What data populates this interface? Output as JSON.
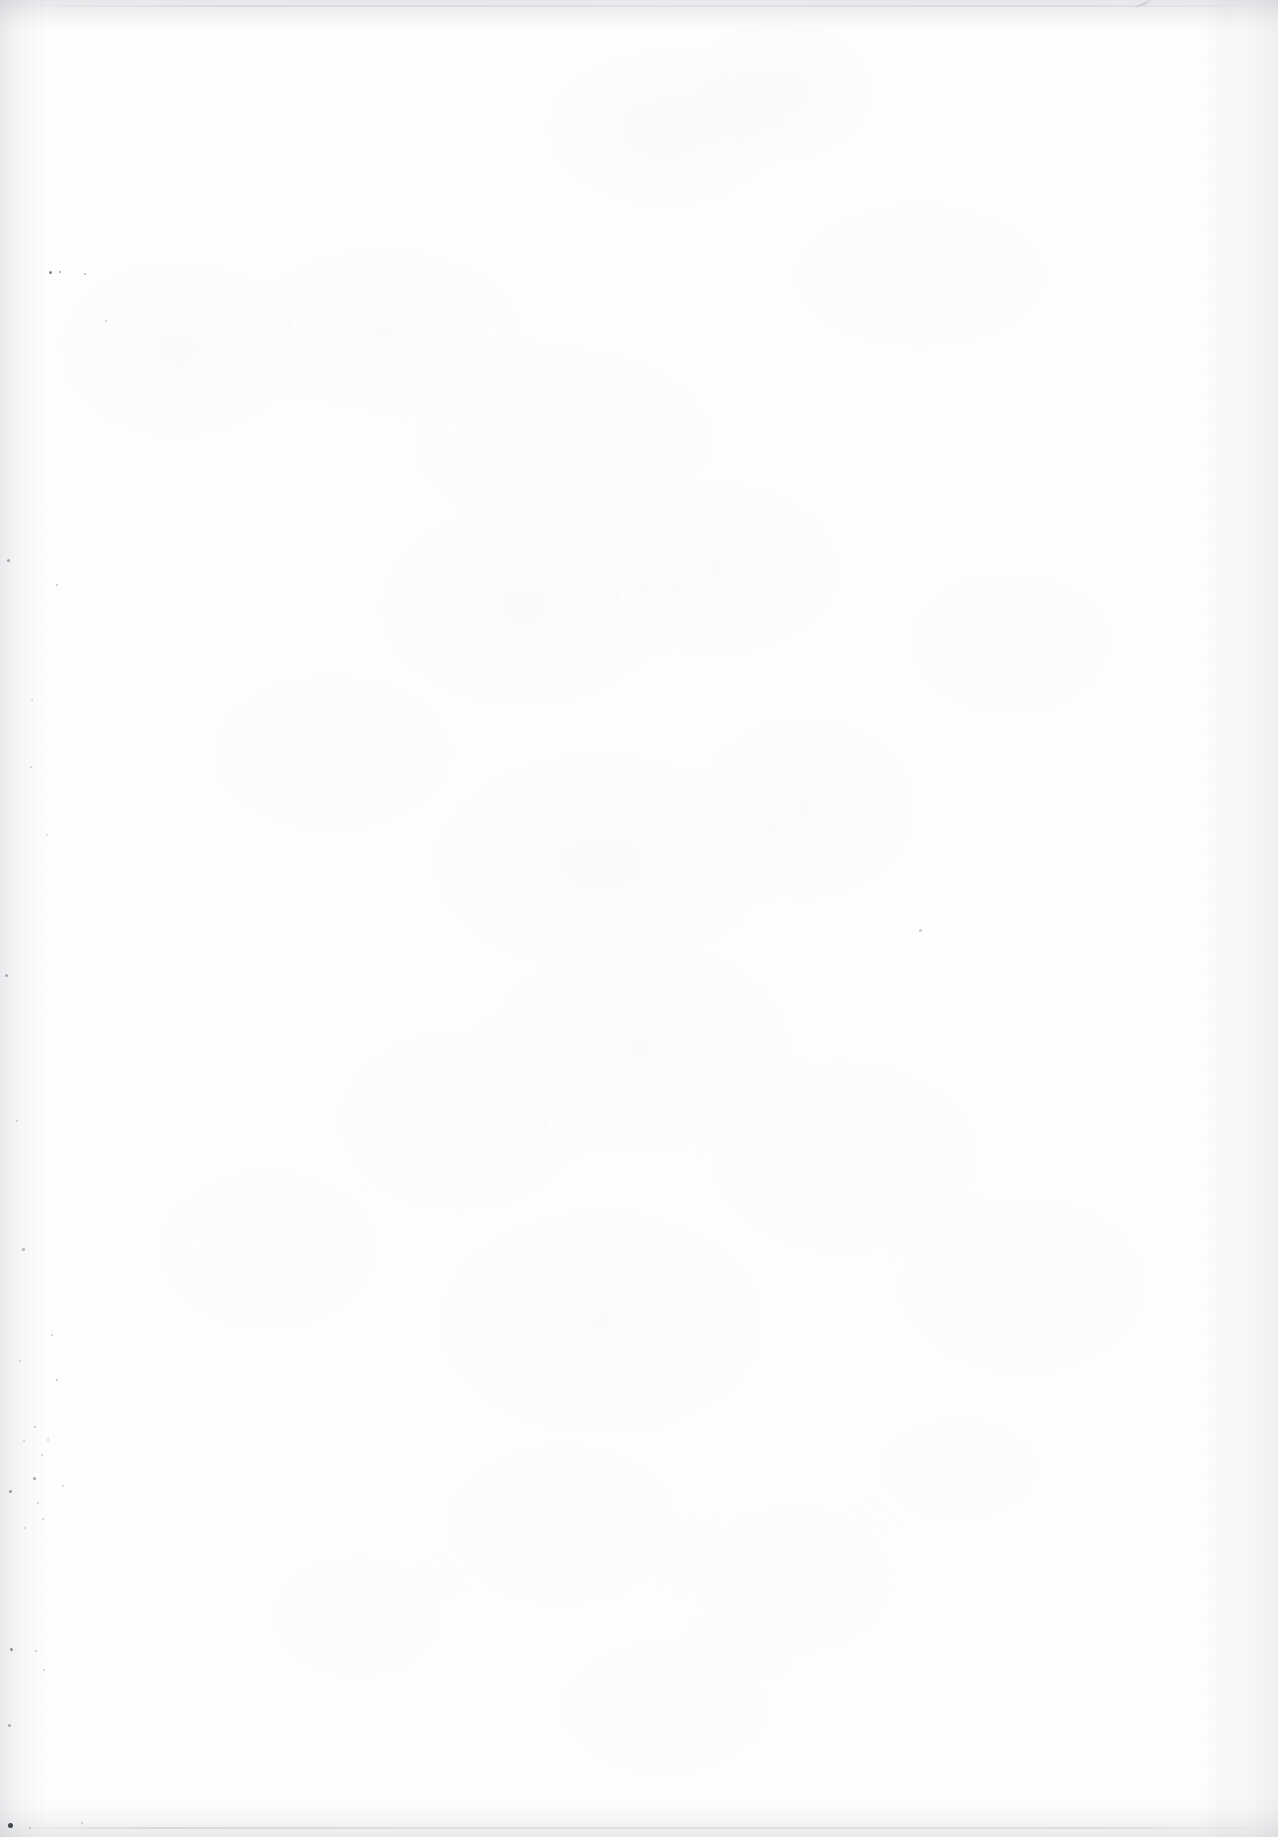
{
  "page": {
    "kind": "scanned-page",
    "content_state": "blank",
    "width_px": 1278,
    "height_px": 1837,
    "accessible_description": "Blank scanned page",
    "visible_text": "",
    "paper_color": "#fefefe",
    "grain_color": "#787d87",
    "edge_shadow_color": "#6c727e"
  },
  "artifacts": {
    "pen_stroke": {
      "name": "pen-stroke-mark",
      "x": 1132,
      "y": 8,
      "length": 26,
      "angle_deg": 24,
      "color": "#b9bcc2"
    },
    "specks": [
      {
        "x": 50,
        "y": 272,
        "size": 3,
        "color": "#4b4f57"
      },
      {
        "x": 60,
        "y": 272,
        "size": 2,
        "color": "#6a6e77"
      },
      {
        "x": 85,
        "y": 274,
        "size": 2,
        "color": "#8d9199"
      },
      {
        "x": 106,
        "y": 321,
        "size": 2,
        "color": "#b0b4ba"
      },
      {
        "x": 8,
        "y": 560,
        "size": 3,
        "color": "#7e828a"
      },
      {
        "x": 57,
        "y": 585,
        "size": 2,
        "color": "#a3a7ad"
      },
      {
        "x": 32,
        "y": 700,
        "size": 2,
        "color": "#b4b8be"
      },
      {
        "x": 31,
        "y": 767,
        "size": 2,
        "color": "#aeb2b8"
      },
      {
        "x": 47,
        "y": 835,
        "size": 2,
        "color": "#bbbfc4"
      },
      {
        "x": 920,
        "y": 930,
        "size": 3,
        "color": "#b6bac0"
      },
      {
        "x": 6,
        "y": 975,
        "size": 3,
        "color": "#8a8e96"
      },
      {
        "x": 17,
        "y": 1121,
        "size": 2,
        "color": "#a8acb2"
      },
      {
        "x": 23,
        "y": 1249,
        "size": 3,
        "color": "#8f939b"
      },
      {
        "x": 52,
        "y": 1335,
        "size": 2,
        "color": "#a6aab0"
      },
      {
        "x": 20,
        "y": 1361,
        "size": 2,
        "color": "#b2b6bc"
      },
      {
        "x": 57,
        "y": 1380,
        "size": 2,
        "color": "#a0a4ab"
      },
      {
        "x": 35,
        "y": 1427,
        "size": 2,
        "color": "#9ea2a9"
      },
      {
        "x": 48,
        "y": 1440,
        "size": 2,
        "color": "#aeb2b8"
      },
      {
        "x": 24,
        "y": 1441,
        "size": 2,
        "color": "#b4b8be"
      },
      {
        "x": 42,
        "y": 1455,
        "size": 2,
        "color": "#a9adb3"
      },
      {
        "x": 34,
        "y": 1478,
        "size": 3,
        "color": "#7d818a"
      },
      {
        "x": 63,
        "y": 1486,
        "size": 2,
        "color": "#b0b4ba"
      },
      {
        "x": 10,
        "y": 1491,
        "size": 3,
        "color": "#6f737c"
      },
      {
        "x": 38,
        "y": 1503,
        "size": 2,
        "color": "#b6bac0"
      },
      {
        "x": 43,
        "y": 1519,
        "size": 2,
        "color": "#a4a8ae"
      },
      {
        "x": 25,
        "y": 1528,
        "size": 2,
        "color": "#b0b4ba"
      },
      {
        "x": 11,
        "y": 1649,
        "size": 3,
        "color": "#5f636c"
      },
      {
        "x": 36,
        "y": 1651,
        "size": 2,
        "color": "#9ea2a9"
      },
      {
        "x": 44,
        "y": 1670,
        "size": 2,
        "color": "#b2b6bc"
      },
      {
        "x": 9,
        "y": 1725,
        "size": 3,
        "color": "#888c94"
      },
      {
        "x": 10,
        "y": 1825,
        "size": 5,
        "color": "#2f333a"
      },
      {
        "x": 30,
        "y": 1828,
        "size": 2,
        "color": "#9a9ea5"
      },
      {
        "x": 82,
        "y": 1823,
        "size": 2,
        "color": "#a8acb2"
      }
    ]
  }
}
